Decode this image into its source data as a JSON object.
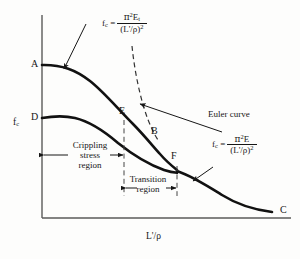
{
  "figure": {
    "type": "column-buckling-stress-curve",
    "axes": {
      "y_label": "f",
      "y_label_sub": "c",
      "x_label": "L'/ρ"
    },
    "points": [
      {
        "id": "A",
        "label": "A",
        "x": 42,
        "y": 65,
        "desc": "start of tangent-modulus curve on y-axis"
      },
      {
        "id": "D",
        "label": "D",
        "x": 42,
        "y": 118,
        "desc": "start of crippling stress curve on y-axis"
      },
      {
        "id": "E",
        "label": "E",
        "x": 124,
        "y": 120,
        "desc": "end of crippling stress region"
      },
      {
        "id": "B",
        "label": "B",
        "x": 160,
        "y": 137,
        "desc": "point on tangent modulus curve"
      },
      {
        "id": "F",
        "label": "F",
        "x": 177,
        "y": 160,
        "desc": "end of transition region"
      },
      {
        "id": "C",
        "label": "C",
        "x": 277,
        "y": 212,
        "desc": "far end of Euler curve"
      }
    ],
    "regions": [
      {
        "id": "crippling",
        "line1": "Crippling",
        "line2": "stress",
        "line3": "region"
      },
      {
        "id": "transition",
        "line1": "Transition",
        "line2": "region"
      }
    ],
    "annotations": [
      {
        "id": "euler-curve-name",
        "text": "Euler curve"
      }
    ],
    "formulas": [
      {
        "id": "tangent-modulus",
        "lhs": "f",
        "lhs_sub": "c",
        "eq": "=",
        "numerator_pi": "π",
        "numerator_pow": "2",
        "numerator_sym": "E",
        "numerator_sub": "t",
        "denominator": "(L'/ρ)",
        "denominator_pow": "2"
      },
      {
        "id": "euler",
        "lhs": "f",
        "lhs_sub": "c",
        "eq": "=",
        "numerator_pi": "π",
        "numerator_pow": "2",
        "numerator_sym": "E",
        "numerator_sub": "",
        "denominator": "(L'/ρ)",
        "denominator_pow": "2"
      }
    ],
    "colors": {
      "ink": "#161616",
      "axis": "#555555",
      "background": "#fdfdfc"
    }
  }
}
